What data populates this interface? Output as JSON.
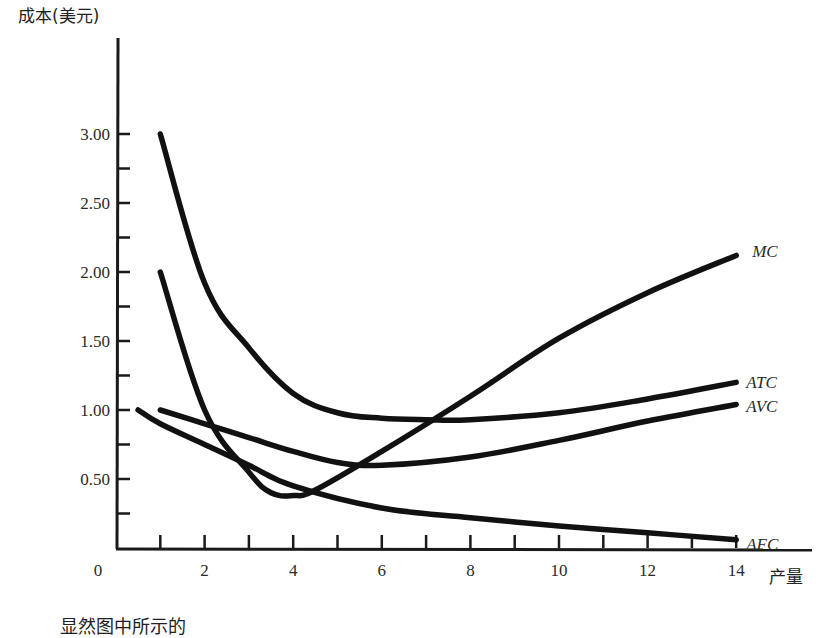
{
  "chart_data": {
    "type": "line",
    "title": "",
    "xlabel": "产量",
    "ylabel": "成本(美元)",
    "xlim": [
      0,
      15
    ],
    "ylim": [
      0,
      3.5
    ],
    "grid": false,
    "legend_position": "inline-right",
    "x_ticks": [
      0,
      2,
      4,
      6,
      8,
      10,
      12,
      14
    ],
    "x_tick_labels": [
      "0",
      "2",
      "4",
      "6",
      "8",
      "10",
      "12",
      "14"
    ],
    "x_minor_ticks": [
      1,
      2,
      3,
      4,
      5,
      6,
      7,
      8,
      9,
      10,
      11,
      12,
      13,
      14
    ],
    "y_ticks": [
      0.5,
      1.0,
      1.5,
      2.0,
      2.5,
      3.0
    ],
    "y_tick_labels": [
      "0.50",
      "1.00",
      "1.50",
      "2.00",
      "2.50",
      "3.00"
    ],
    "y_minor_ticks": [
      0.25,
      0.75,
      1.25,
      1.75,
      2.25,
      2.75
    ],
    "series": [
      {
        "name": "MC",
        "x": [
          1,
          2,
          3,
          3.5,
          4,
          4.5,
          6,
          8,
          10,
          12,
          14
        ],
        "values": [
          2.0,
          1.0,
          0.55,
          0.4,
          0.38,
          0.42,
          0.7,
          1.1,
          1.52,
          1.85,
          2.12
        ]
      },
      {
        "name": "ATC",
        "x": [
          1,
          2,
          3,
          4,
          5,
          6,
          7,
          8,
          10,
          12,
          14
        ],
        "values": [
          3.0,
          1.92,
          1.45,
          1.12,
          0.98,
          0.94,
          0.93,
          0.93,
          0.98,
          1.08,
          1.2
        ]
      },
      {
        "name": "AVC",
        "x": [
          1,
          2,
          3,
          4,
          5,
          6,
          8,
          10,
          12,
          14
        ],
        "values": [
          1.0,
          0.9,
          0.8,
          0.7,
          0.62,
          0.6,
          0.66,
          0.78,
          0.92,
          1.04
        ]
      },
      {
        "name": "AFC",
        "x": [
          0.5,
          1,
          2,
          3,
          4,
          6,
          8,
          10,
          12,
          14
        ],
        "values": [
          1.0,
          0.9,
          0.75,
          0.6,
          0.45,
          0.29,
          0.22,
          0.16,
          0.11,
          0.06
        ]
      }
    ]
  },
  "caption": "显然图中所示的"
}
